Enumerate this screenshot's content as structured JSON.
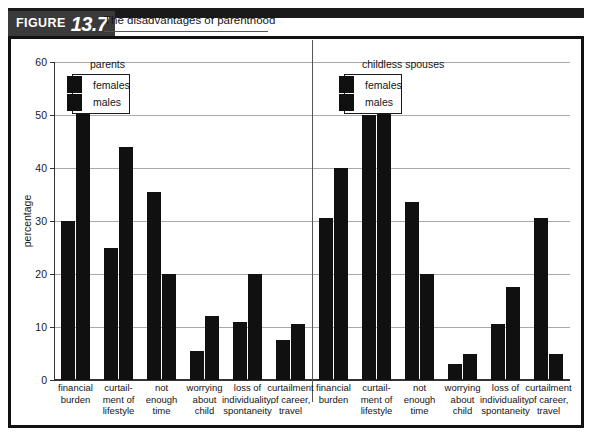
{
  "figure": {
    "tag_word": "FIGURE",
    "number": "13.7",
    "title": "The disadvantages of parenthood"
  },
  "legends": {
    "left": {
      "title": "parents",
      "series": [
        "females",
        "males"
      ]
    },
    "right": {
      "title": "childless spouses",
      "series": [
        "females",
        "males"
      ]
    }
  },
  "chart_data": {
    "type": "bar",
    "title": "The disadvantages of parenthood",
    "xlabel": "",
    "ylabel": "percentage",
    "ylim": [
      0,
      60
    ],
    "yticks": [
      0,
      10,
      20,
      30,
      40,
      50,
      60
    ],
    "ytick_labels": [
      "0",
      "10",
      "20",
      "30",
      "40",
      "50",
      "60"
    ],
    "grid": true,
    "legend_position": "top-left-of-each-panel",
    "panels": [
      {
        "name": "parents",
        "categories": [
          "financial burden",
          "curtailment of lifestyle",
          "not enough time",
          "worrying about child",
          "loss of individuality, spontaneity",
          "curtailment of career, travel"
        ],
        "series": [
          {
            "name": "females",
            "values": [
              30,
              25,
              35.5,
              5.5,
              11,
              7.5
            ]
          },
          {
            "name": "males",
            "values": [
              51,
              44,
              20,
              12,
              20,
              10.5
            ]
          }
        ]
      },
      {
        "name": "childless spouses",
        "categories": [
          "financial burden",
          "curtailment of lifestyle",
          "not enough time",
          "worrying about child",
          "loss of individuality, spontaneity",
          "curtailment of career, travel"
        ],
        "series": [
          {
            "name": "females",
            "values": [
              30.5,
              50,
              33.5,
              3,
              10.5,
              30.5
            ]
          },
          {
            "name": "males",
            "values": [
              40,
              55.5,
              20,
              5,
              17.5,
              5
            ]
          }
        ]
      }
    ]
  },
  "category_labels": [
    [
      "financial",
      "burden"
    ],
    [
      "curtail-",
      "ment of",
      "lifestyle"
    ],
    [
      "not",
      "enough",
      "time"
    ],
    [
      "worrying",
      "about",
      "child"
    ],
    [
      "loss of",
      "individuality,",
      "spontaneity"
    ],
    [
      "curtailment",
      "of career,",
      "travel"
    ]
  ],
  "colors": {
    "bar": "#101010",
    "frame": "#111111",
    "grid": "#a9a9a9",
    "banner": "#1a1a1a",
    "tag": "#3a3a3a"
  }
}
